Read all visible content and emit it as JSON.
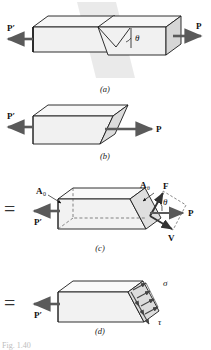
{
  "figure": {
    "number_label": "Fig. 1.40",
    "panels": [
      {
        "id": "a",
        "caption": "(a)",
        "labels": {
          "left_force": "P′",
          "right_force": "P",
          "angle": "θ"
        }
      },
      {
        "id": "b",
        "caption": "(b)",
        "labels": {
          "left_force": "P′",
          "right_force": "P"
        }
      },
      {
        "id": "c",
        "caption": "(c)",
        "labels": {
          "left_force": "P′",
          "right_force": "P",
          "area_axial": "A",
          "area_axial_sub": "0",
          "area_oblique": "A",
          "area_oblique_sub": "θ",
          "normal_force": "F",
          "shear_force": "V",
          "angle": "θ"
        },
        "equals_sign": "="
      },
      {
        "id": "d",
        "caption": "(d)",
        "labels": {
          "left_force": "P′",
          "normal_stress": "σ",
          "shear_stress": "τ"
        },
        "equals_sign": "="
      }
    ]
  },
  "colors": {
    "outline": "#1a1a1a",
    "face_light": "#f4f4f4",
    "face_mid": "#e8e8e8",
    "face_dark": "#d0d0d0",
    "arrow": "#5a5a5a",
    "plane_tint": "#e3e3e3",
    "dashed": "#555555",
    "caption_text": "#1a1a1a",
    "figure_label": "#bdbdbd"
  }
}
